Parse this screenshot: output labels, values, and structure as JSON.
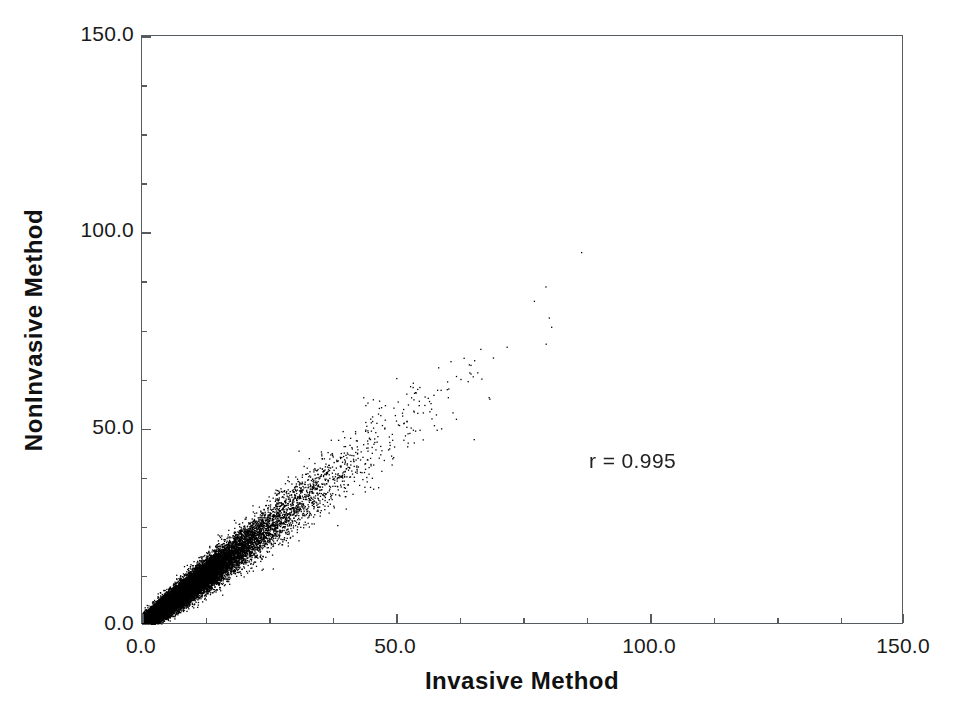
{
  "chart_data": {
    "type": "scatter",
    "title": "",
    "xlabel": "Invasive Method",
    "ylabel": "NonInvasive Method",
    "xlim": [
      0.0,
      150.0
    ],
    "ylim": [
      0.0,
      150.0
    ],
    "grid": false,
    "legend": null,
    "x_ticks": [
      0.0,
      50.0,
      100.0,
      150.0
    ],
    "x_tick_labels": [
      "0.0",
      "50.0",
      "100.0",
      "150.0"
    ],
    "y_ticks": [
      0.0,
      50.0,
      100.0,
      150.0
    ],
    "y_tick_labels": [
      "0.0",
      "50.0",
      "100.0",
      "150.0"
    ],
    "x_minor_tick_interval": 12.5,
    "y_minor_tick_interval": 12.5,
    "tick_direction": "in",
    "marker": "dot",
    "marker_color": "#000000",
    "marker_size_px": 1.3,
    "point_count": 20000,
    "annotations": [
      {
        "text": "r = 0.995",
        "x_data": 100.0,
        "y_data": 41.0
      }
    ],
    "relationship": {
      "form": "linear",
      "slope": 1.0,
      "intercept": 0.0,
      "correlation_r": 0.995,
      "noise_model": "proportional-plus-floor",
      "noise_sd_floor": 0.9,
      "noise_sd_proportional": 0.085,
      "x_distribution": "exponential-like, heavily concentrated near 0",
      "x_mean_approx": 9.0,
      "x_max_observed": 113.0,
      "y_max_observed": 111.0,
      "density_note": "saturated solid black below x=10, thinning band to x~60, sparse outliers to x~113"
    },
    "axis_color": "#555b5e",
    "background_color": "#ffffff",
    "text_color": "#1a1a1a"
  },
  "annotation_text": "r = 0.995"
}
